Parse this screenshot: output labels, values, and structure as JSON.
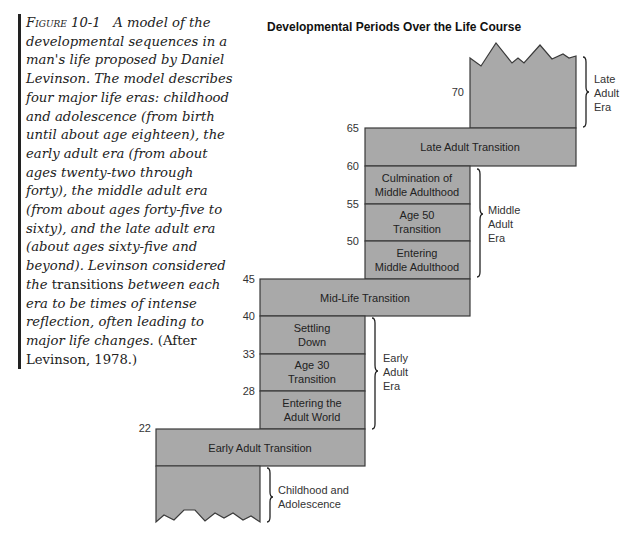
{
  "caption": {
    "figure_label": "Figure 10-1",
    "text_1": "A model of the developmental sequences in a man's life proposed by Daniel Levinson. The model describes four major life eras: childhood and adolescence (from birth until about age eighteen), the early adult era (from about ages twenty-two through forty), the middle adult era (from about ages forty-five to sixty), and the late adult era (about ages sixty-five and beyond). Levinson considered the",
    "emphasis": "transitions",
    "text_2": "between each era to be times of intense reflection, often leading to major life changes.",
    "citation": "(After Levinson, 1978.)"
  },
  "diagram": {
    "title": "Developmental Periods Over the Life Course",
    "fill_color": "#a9a9a9",
    "stroke_color": "#3a3a3a",
    "ages": {
      "a22": "22",
      "a28": "28",
      "a33": "33",
      "a40": "40",
      "a45": "45",
      "a50": "50",
      "a55": "55",
      "a60": "60",
      "a65": "65",
      "a70": "70"
    },
    "periods": {
      "early_adult_transition": [
        "Early Adult Transition"
      ],
      "entering_adult_world": [
        "Entering the",
        "Adult World"
      ],
      "age_30_transition": [
        "Age 30",
        "Transition"
      ],
      "settling_down": [
        "Settling",
        "Down"
      ],
      "mid_life_transition": [
        "Mid-Life Transition"
      ],
      "entering_middle_adulthood": [
        "Entering",
        "Middle Adulthood"
      ],
      "age_50_transition": [
        "Age 50",
        "Transition"
      ],
      "culmination_middle_adulthood": [
        "Culmination of",
        "Middle Adulthood"
      ],
      "late_adult_transition": [
        "Late Adult Transition"
      ]
    },
    "eras": {
      "childhood": [
        "Childhood and",
        "Adolescence"
      ],
      "early_adult": [
        "Early",
        "Adult",
        "Era"
      ],
      "middle_adult": [
        "Middle",
        "Adult",
        "Era"
      ],
      "late_adult": [
        "Late",
        "Adult",
        "Era"
      ]
    }
  }
}
